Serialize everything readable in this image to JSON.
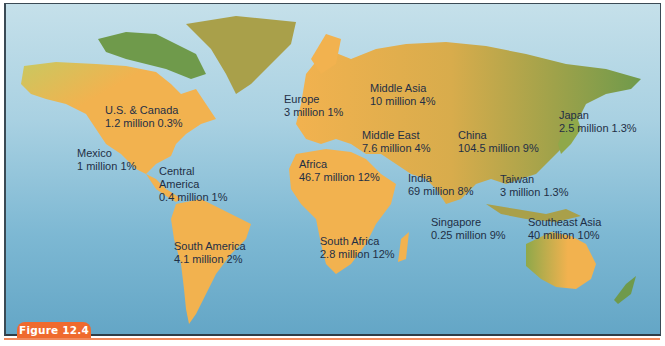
{
  "figure": {
    "label": "Figure 12.4"
  },
  "colors": {
    "ocean_top": "#c5e0ea",
    "ocean_bottom": "#64a6c6",
    "land_orange": "#f2b24f",
    "land_green": "#6f9a4b",
    "land_olive": "#a9a04a",
    "badge": "#ef6a2e",
    "text": "#1f2f45"
  },
  "regions": [
    {
      "id": "us-canada",
      "name": "U.S. & Canada",
      "value": "1.2 million 0.3%"
    },
    {
      "id": "mexico",
      "name": "Mexico",
      "value": "1 million 1%"
    },
    {
      "id": "central-america",
      "name": "Central America",
      "name_line1": "Central",
      "name_line2": "America",
      "value": "0.4 million 1%"
    },
    {
      "id": "south-america",
      "name": "South America",
      "value": "4.1 million 2%"
    },
    {
      "id": "europe",
      "name": "Europe",
      "value": "3 million 1%"
    },
    {
      "id": "middle-asia",
      "name": "Middle Asia",
      "value": "10 million 4%"
    },
    {
      "id": "middle-east",
      "name": "Middle East",
      "value": "7.6 million 4%"
    },
    {
      "id": "africa",
      "name": "Africa",
      "value": "46.7 million 12%"
    },
    {
      "id": "south-africa",
      "name": "South Africa",
      "value": "2.8 million 12%"
    },
    {
      "id": "india",
      "name": "India",
      "value": "69 million 8%"
    },
    {
      "id": "china",
      "name": "China",
      "value": "104.5 million 9%"
    },
    {
      "id": "japan",
      "name": "Japan",
      "value": "2.5 million 1.3%"
    },
    {
      "id": "taiwan",
      "name": "Taiwan",
      "value": "3 million 1.3%"
    },
    {
      "id": "singapore",
      "name": "Singapore",
      "value": "0.25 million 9%"
    },
    {
      "id": "southeast-asia",
      "name": "Southeast Asia",
      "value": "40 million 10%"
    }
  ]
}
